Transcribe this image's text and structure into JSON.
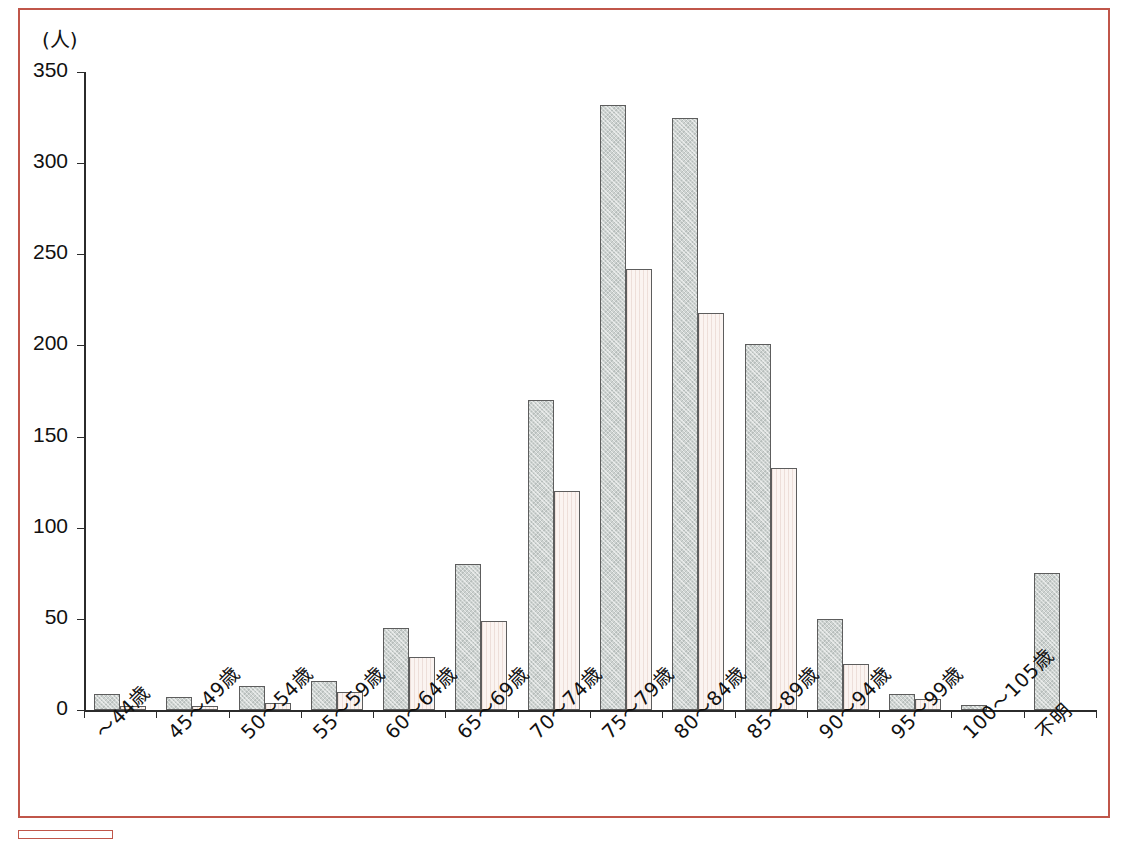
{
  "chart_data": {
    "type": "bar",
    "title": "",
    "subtitle": "",
    "xlabel": "",
    "ylabel": "(人)",
    "unit_label": "(人)",
    "ylim": [
      0,
      350
    ],
    "yticks": [
      0,
      50,
      100,
      150,
      200,
      250,
      300,
      350
    ],
    "grid": false,
    "legend_position": "none",
    "categories": [
      "～44歳",
      "45～49歳",
      "50～54歳",
      "55～59歳",
      "60～64歳",
      "65～69歳",
      "70～74歳",
      "75～79歳",
      "80～84歳",
      "85～89歳",
      "90～94歳",
      "95～99歳",
      "100～105歳",
      "不明"
    ],
    "series": [
      {
        "name": "series-1",
        "color": "#ced3d1",
        "values": [
          9,
          7,
          13,
          16,
          45,
          80,
          170,
          332,
          325,
          201,
          50,
          9,
          3,
          75
        ]
      },
      {
        "name": "series-2",
        "color": "#fbf4f1",
        "values": [
          2,
          2,
          4,
          10,
          29,
          49,
          120,
          242,
          218,
          133,
          25,
          6,
          0,
          0
        ]
      }
    ]
  },
  "frame": {
    "border_color": "#c0564a"
  }
}
